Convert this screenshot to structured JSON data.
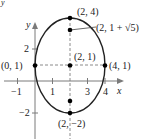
{
  "figure": {
    "axes": {
      "x_label": "x",
      "y_label": "y",
      "x_ticks": [
        "−1",
        "1",
        "3",
        "4"
      ],
      "y_ticks": [
        "2",
        "−2"
      ]
    },
    "ellipse": {
      "center": [
        2,
        1
      ],
      "semi_major_vertical": 3,
      "semi_minor_horizontal": 2
    },
    "points": [
      {
        "label": "(2, 4)",
        "x": 2,
        "y": 4
      },
      {
        "label": "(2, 1 + √5)",
        "x": 2,
        "y": 3.236
      },
      {
        "label": "(0, 1)",
        "x": 0,
        "y": 1
      },
      {
        "label": "(2, 1)",
        "x": 2,
        "y": 1
      },
      {
        "label": "(4, 1)",
        "x": 4,
        "y": 1
      },
      {
        "label": "(2, −2)",
        "x": 2,
        "y": -2
      }
    ],
    "unlabeled_points": [
      {
        "x": 2,
        "y": -1.236
      }
    ],
    "colors": {
      "curve": "#222222",
      "axes": "#7a7a7a",
      "dashed": "#8a8a8a",
      "points": "#000000"
    }
  }
}
